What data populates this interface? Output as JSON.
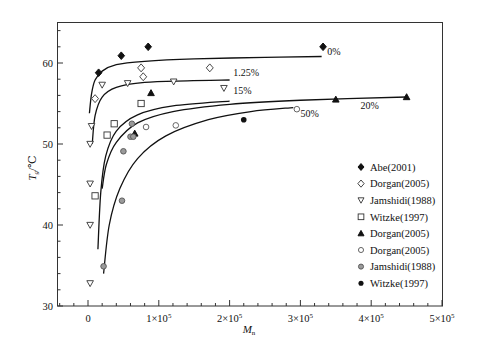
{
  "chart_data": {
    "type": "scatter",
    "title": "",
    "xlabel": "M_n",
    "ylabel": "T_g/℃",
    "xlim": [
      -25000,
      500000
    ],
    "ylim": [
      30,
      65
    ],
    "grid": false,
    "legend_position": "inside-right",
    "x_ticks": [
      {
        "value": 0,
        "label": "0"
      },
      {
        "value": 100000,
        "label": "1×10",
        "exp": "5"
      },
      {
        "value": 200000,
        "label": "2×10",
        "exp": "5"
      },
      {
        "value": 300000,
        "label": "3×10",
        "exp": "5"
      },
      {
        "value": 400000,
        "label": "4×10",
        "exp": "5"
      },
      {
        "value": 500000,
        "label": "5×10",
        "exp": "5"
      }
    ],
    "y_ticks": [
      {
        "value": 30,
        "label": "30"
      },
      {
        "value": 40,
        "label": "40"
      },
      {
        "value": 50,
        "label": "50"
      },
      {
        "value": 60,
        "label": "60"
      }
    ],
    "series": [
      {
        "name": "Abe(2001)",
        "marker": "diamond-filled",
        "points": [
          [
            15000,
            58.8
          ],
          [
            47000,
            60.9
          ],
          [
            85000,
            62.0
          ],
          [
            332000,
            62.0
          ]
        ]
      },
      {
        "name": "Dorgan(2005)",
        "marker": "diamond-open",
        "points": [
          [
            10000,
            55.6
          ],
          [
            75000,
            59.4
          ],
          [
            78000,
            58.3
          ],
          [
            172000,
            59.4
          ]
        ]
      },
      {
        "name": "Jamshidi(1988)",
        "marker": "triangle-down-open",
        "points": [
          [
            3000,
            32.8
          ],
          [
            3000,
            40.0
          ],
          [
            3000,
            45.1
          ],
          [
            3000,
            50.0
          ],
          [
            5000,
            52.2
          ],
          [
            20000,
            57.3
          ],
          [
            56000,
            57.5
          ],
          [
            121000,
            57.7
          ],
          [
            192000,
            56.9
          ]
        ]
      },
      {
        "name": "Witzke(1997)",
        "marker": "square-open",
        "points": [
          [
            10000,
            43.6
          ],
          [
            27000,
            51.1
          ],
          [
            37000,
            52.5
          ],
          [
            75000,
            55.0
          ]
        ]
      },
      {
        "name": "Dorgan(2005)",
        "marker": "triangle-up-filled",
        "points": [
          [
            66000,
            51.3
          ],
          [
            89000,
            56.3
          ],
          [
            350000,
            55.5
          ],
          [
            450000,
            55.8
          ]
        ]
      },
      {
        "name": "Dorgan(2005)",
        "marker": "circle-open",
        "points": [
          [
            82000,
            52.1
          ],
          [
            124000,
            52.3
          ],
          [
            295000,
            54.3
          ]
        ]
      },
      {
        "name": "Jamshidi(1988)",
        "marker": "circle-gray",
        "points": [
          [
            22000,
            34.9
          ],
          [
            48000,
            43.0
          ],
          [
            50000,
            49.1
          ],
          [
            60000,
            50.9
          ],
          [
            64000,
            50.9
          ],
          [
            62000,
            52.5
          ]
        ]
      },
      {
        "name": "Witzke(1997)",
        "marker": "circle-filled",
        "points": [
          [
            220000,
            53.0
          ]
        ]
      }
    ],
    "fit_curves": [
      {
        "label": "0%",
        "label_pos": [
          338000,
          61.0
        ],
        "points": [
          [
            2000,
            53.8
          ],
          [
            5000,
            56.2
          ],
          [
            10000,
            57.9
          ],
          [
            20000,
            59.0
          ],
          [
            40000,
            59.8
          ],
          [
            80000,
            60.2
          ],
          [
            150000,
            60.5
          ],
          [
            250000,
            60.7
          ],
          [
            330000,
            60.8
          ]
        ]
      },
      {
        "label": "1.25%",
        "label_pos": [
          205000,
          58.4
        ],
        "points": [
          [
            6000,
            50.0
          ],
          [
            10000,
            53.5
          ],
          [
            20000,
            55.8
          ],
          [
            40000,
            57.0
          ],
          [
            80000,
            57.6
          ],
          [
            140000,
            57.8
          ],
          [
            200000,
            57.9
          ]
        ]
      },
      {
        "label": "15%",
        "label_pos": [
          205000,
          56.2
        ],
        "points": [
          [
            14000,
            37.0
          ],
          [
            18000,
            44.0
          ],
          [
            25000,
            48.5
          ],
          [
            40000,
            51.6
          ],
          [
            70000,
            53.6
          ],
          [
            120000,
            54.7
          ],
          [
            200000,
            55.3
          ]
        ]
      },
      {
        "label": "20%",
        "label_pos": [
          385000,
          54.3
        ],
        "points": [
          [
            20000,
            44.5
          ],
          [
            26000,
            47.5
          ],
          [
            40000,
            50.2
          ],
          [
            70000,
            52.6
          ],
          [
            120000,
            54.0
          ],
          [
            200000,
            54.9
          ],
          [
            300000,
            55.4
          ],
          [
            450000,
            55.8
          ]
        ]
      },
      {
        "label": "50%",
        "label_pos": [
          300000,
          53.3
        ],
        "points": [
          [
            22000,
            34.0
          ],
          [
            30000,
            40.0
          ],
          [
            45000,
            44.5
          ],
          [
            70000,
            48.2
          ],
          [
            110000,
            51.0
          ],
          [
            170000,
            53.0
          ],
          [
            230000,
            54.0
          ],
          [
            290000,
            54.5
          ]
        ]
      }
    ]
  }
}
